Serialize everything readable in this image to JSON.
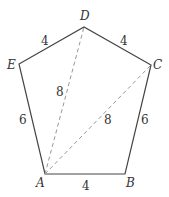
{
  "diagram": {
    "type": "pentagon",
    "vertices": [
      {
        "name": "A",
        "x": 45,
        "y": 174,
        "lx": 37,
        "ly": 187
      },
      {
        "name": "B",
        "x": 125,
        "y": 174,
        "lx": 127,
        "ly": 187
      },
      {
        "name": "C",
        "x": 151,
        "y": 65,
        "lx": 153,
        "ly": 68
      },
      {
        "name": "D",
        "x": 84,
        "y": 27,
        "lx": 80,
        "ly": 20
      },
      {
        "name": "E",
        "x": 19,
        "y": 64,
        "lx": 7,
        "ly": 68
      }
    ],
    "sides": [
      {
        "from": "A",
        "to": "B",
        "label": "4"
      },
      {
        "from": "B",
        "to": "C",
        "label": "6"
      },
      {
        "from": "C",
        "to": "D",
        "label": "4"
      },
      {
        "from": "D",
        "to": "E",
        "label": "4"
      },
      {
        "from": "E",
        "to": "A",
        "label": "6"
      }
    ],
    "diagonals": [
      {
        "from": "A",
        "to": "D",
        "label": "8"
      },
      {
        "from": "A",
        "to": "C",
        "label": "8"
      }
    ],
    "labels": {
      "A": "A",
      "B": "B",
      "C": "C",
      "D": "D",
      "E": "E",
      "AB": "4",
      "BC": "6",
      "CD": "4",
      "DE": "4",
      "EA": "6",
      "AD": "8",
      "AC": "8"
    }
  }
}
